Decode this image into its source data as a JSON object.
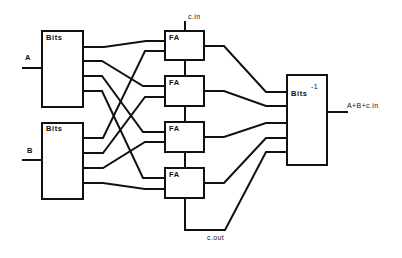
{
  "diagram": {
    "type": "block-diagram",
    "inputs": {
      "a_label": "A",
      "b_label": "B",
      "carry_in_label": "c.in"
    },
    "outputs": {
      "sum_label": "A+B+c.in",
      "carry_out_label": "c.out"
    },
    "blocks": {
      "bits_a": {
        "label": "Bits"
      },
      "bits_b": {
        "label": "Bits"
      },
      "full_adders": [
        {
          "label": "FA"
        },
        {
          "label": "FA"
        },
        {
          "label": "FA"
        },
        {
          "label": "FA"
        }
      ],
      "bits_inverse": {
        "label": "Bits",
        "superscript": "-1"
      }
    },
    "connections": [
      {
        "from": "bits_a.out0",
        "to": "fa0.in_a"
      },
      {
        "from": "bits_a.out1",
        "to": "fa1.in_a"
      },
      {
        "from": "bits_a.out2",
        "to": "fa2.in_a"
      },
      {
        "from": "bits_a.out3",
        "to": "fa3.in_a"
      },
      {
        "from": "bits_b.out0",
        "to": "fa0.in_b"
      },
      {
        "from": "bits_b.out1",
        "to": "fa1.in_b"
      },
      {
        "from": "bits_b.out2",
        "to": "fa2.in_b"
      },
      {
        "from": "bits_b.out3",
        "to": "fa3.in_b"
      },
      {
        "from": "c.in",
        "to": "fa0.carry_in"
      },
      {
        "from": "fa0.carry_out",
        "to": "fa1.carry_in"
      },
      {
        "from": "fa1.carry_out",
        "to": "fa2.carry_in"
      },
      {
        "from": "fa2.carry_out",
        "to": "fa3.carry_in"
      },
      {
        "from": "fa3.carry_out",
        "to": "c.out"
      },
      {
        "from": "fa0.sum",
        "to": "bits_inverse.in0"
      },
      {
        "from": "fa1.sum",
        "to": "bits_inverse.in1"
      },
      {
        "from": "fa2.sum",
        "to": "bits_inverse.in2"
      },
      {
        "from": "fa3.sum",
        "to": "bits_inverse.in3"
      },
      {
        "from": "c.out",
        "to": "bits_inverse.in4"
      },
      {
        "from": "bits_inverse.out",
        "to": "A+B+c.in"
      }
    ],
    "colors": {
      "stroke": "#111111",
      "background": "#ffffff"
    }
  }
}
